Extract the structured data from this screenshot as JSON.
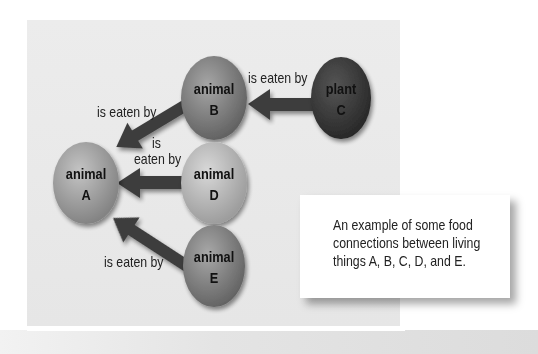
{
  "diagram": {
    "type": "food-web",
    "nodes": [
      {
        "id": "A",
        "kind": "animal",
        "line1": "animal",
        "line2": "A",
        "color": "#a9a9a9"
      },
      {
        "id": "B",
        "kind": "animal",
        "line1": "animal",
        "line2": "B",
        "color": "#8c8c8c"
      },
      {
        "id": "C",
        "kind": "plant",
        "line1": "plant",
        "line2": "C",
        "color": "#3c3c3c"
      },
      {
        "id": "D",
        "kind": "animal",
        "line1": "animal",
        "line2": "D",
        "color": "#bdbdbd"
      },
      {
        "id": "E",
        "kind": "animal",
        "line1": "animal",
        "line2": "E",
        "color": "#8a8a8a"
      }
    ],
    "edges": [
      {
        "from": "C",
        "to": "B",
        "label": "is eaten by"
      },
      {
        "from": "B",
        "to": "A",
        "label": "is eaten by"
      },
      {
        "from": "D",
        "to": "A",
        "label_line1": "is",
        "label_line2": "eaten by"
      },
      {
        "from": "E",
        "to": "A",
        "label": "is eaten by"
      }
    ]
  },
  "caption": "An example of some food connections between living things A, B, C, D, and E."
}
